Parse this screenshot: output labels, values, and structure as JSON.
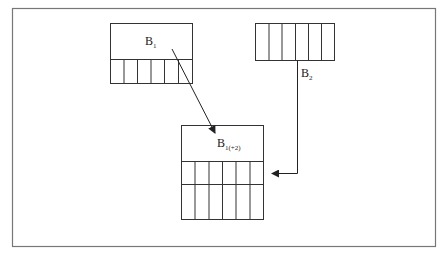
{
  "diagram": {
    "blocks": [
      {
        "id": "B1",
        "label": "B",
        "subscript": "1",
        "cells": 6,
        "rows": 1
      },
      {
        "id": "B2",
        "label": "B",
        "subscript": "2",
        "cells": 6,
        "rows": 1
      },
      {
        "id": "B1+2",
        "label": "B",
        "subscript": "1(+2)",
        "cells": 6,
        "rows": 2
      }
    ],
    "edges": [
      {
        "from": "B1",
        "to": "B1+2"
      },
      {
        "from": "B2",
        "to": "B1+2"
      }
    ],
    "colors": {
      "stroke": "#333333",
      "frame": "#777777",
      "background": "#ffffff"
    }
  }
}
